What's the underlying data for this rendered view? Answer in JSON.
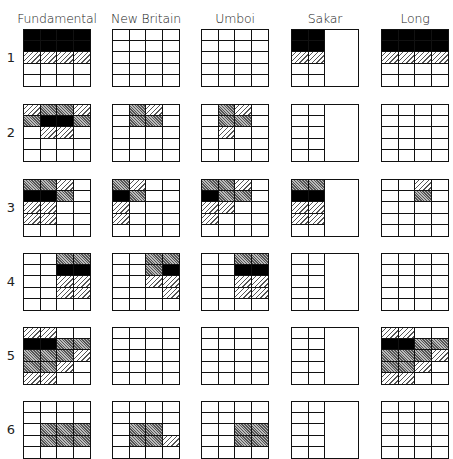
{
  "columns": [
    "Fundamental",
    "New Britain",
    "Umboi",
    "Sakar",
    "Long"
  ],
  "rows": [
    "1",
    "2",
    "3",
    "4",
    "5",
    "6"
  ],
  "legend": {
    "B": "black (solid fill)",
    "D": "dense hatching (gray)",
    "L": "light diagonal hatching",
    "_": "empty"
  },
  "colors": {
    "line": "#111111",
    "solid": "#000000",
    "background": "#ffffff"
  },
  "grids": {
    "Fundamental": [
      [
        "BBBB",
        "BBBB",
        "LLLL",
        "____",
        "____"
      ],
      [
        "LDDL",
        "DBBD",
        "_LL_",
        "____",
        "____"
      ],
      [
        "DDL_",
        "BBD_",
        "LL__",
        "LL__",
        "____"
      ],
      [
        "__DD",
        "__BB",
        "__LL",
        "__LL",
        "____"
      ],
      [
        "LL__",
        "BBDD",
        "DDDL",
        "DDL_",
        "LL__"
      ],
      [
        "____",
        "____",
        "_DDD",
        "_DDD",
        "____"
      ]
    ],
    "New Britain": [
      [
        "____",
        "____",
        "____",
        "____",
        "____"
      ],
      [
        "_DL_",
        "_DD_",
        "____",
        "____",
        "____"
      ],
      [
        "DL__",
        "BD__",
        "L___",
        "L___",
        "____"
      ],
      [
        "__DD",
        "__DB",
        "__LL",
        "___L",
        "____"
      ],
      [
        "____",
        "____",
        "____",
        "____",
        "____"
      ],
      [
        "____",
        "____",
        "_DD_",
        "_DDL",
        "____"
      ]
    ],
    "Umboi": [
      [
        "____",
        "____",
        "____",
        "____",
        "____"
      ],
      [
        "_DL_",
        "_DD_",
        "_L__",
        "____",
        "____"
      ],
      [
        "DDL_",
        "BDD_",
        "LL__",
        "L___",
        "____"
      ],
      [
        "__DD",
        "__BB",
        "__LL",
        "__LL",
        "____"
      ],
      [
        "____",
        "____",
        "____",
        "____",
        "____"
      ],
      [
        "____",
        "____",
        "__DD",
        "__DD",
        "____"
      ]
    ],
    "Sakar": [
      [
        "BB",
        "BB",
        "LL",
        "__",
        "__"
      ],
      [
        "__",
        "__",
        "__",
        "__",
        "__"
      ],
      [
        "DD",
        "BB",
        "LL",
        "LL",
        "__"
      ],
      [
        "__",
        "__",
        "__",
        "__",
        "__"
      ],
      [
        "__",
        "__",
        "__",
        "__",
        "__"
      ],
      [
        "__",
        "__",
        "__",
        "__",
        "__"
      ]
    ],
    "Long": [
      [
        "BBBB",
        "BBBB",
        "LLLL",
        "____",
        "____"
      ],
      [
        "____",
        "____",
        "____",
        "____",
        "____"
      ],
      [
        "__L_",
        "__D_",
        "____",
        "____",
        "____"
      ],
      [
        "____",
        "____",
        "____",
        "____",
        "____"
      ],
      [
        "LL__",
        "BBDD",
        "DDDL",
        "DDL_",
        "LL__"
      ],
      [
        "____",
        "____",
        "____",
        "____",
        "____"
      ]
    ]
  }
}
